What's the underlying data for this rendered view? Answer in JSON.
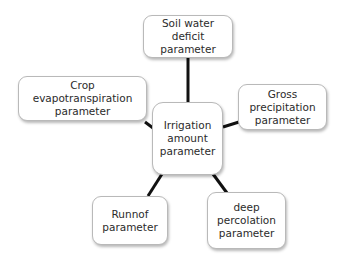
{
  "diagram": {
    "type": "hub-and-spoke",
    "center": {
      "id": "irrigation",
      "lines": [
        "Irrigation",
        "amount",
        "parameter"
      ]
    },
    "nodes": [
      {
        "id": "soil",
        "lines": [
          "Soil water deficit",
          "parameter"
        ]
      },
      {
        "id": "crop",
        "lines": [
          "Crop evapotranspiration",
          "parameter"
        ]
      },
      {
        "id": "gross",
        "lines": [
          "Gross",
          "precipitation",
          "parameter"
        ]
      },
      {
        "id": "runoff",
        "lines": [
          "Runnof",
          "parameter"
        ]
      },
      {
        "id": "deep",
        "lines": [
          "deep",
          "percolation",
          "parameter"
        ]
      }
    ],
    "edges": [
      {
        "from": "irrigation",
        "to": "soil"
      },
      {
        "from": "irrigation",
        "to": "crop"
      },
      {
        "from": "irrigation",
        "to": "gross"
      },
      {
        "from": "irrigation",
        "to": "runoff"
      },
      {
        "from": "irrigation",
        "to": "deep"
      }
    ],
    "colors": {
      "connector": "#111111",
      "box_border": "#b9b9b9",
      "box_fill": "#ffffff",
      "text": "#2b2b2b"
    }
  }
}
